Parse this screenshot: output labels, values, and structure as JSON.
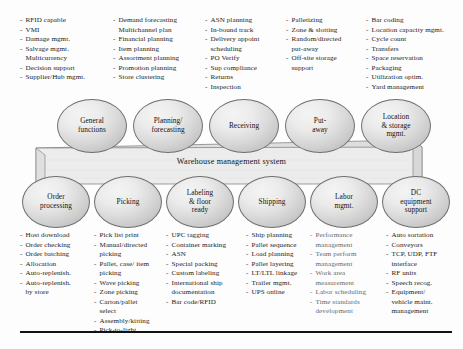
{
  "diagram": {
    "band_label": "Warehouse management system",
    "top_row": [
      {
        "name": "General\nfunctions"
      },
      {
        "name": "Planning/\nforecasting"
      },
      {
        "name": "Receiving"
      },
      {
        "name": "Put-\naway"
      },
      {
        "name": "Location\n& storage\nmgmt."
      }
    ],
    "bottom_row": [
      {
        "name": "Order\nprocessing"
      },
      {
        "name": "Picking"
      },
      {
        "name": "Labeling\n& floor\nready"
      },
      {
        "name": "Shipping"
      },
      {
        "name": "Labor\nmgmt."
      },
      {
        "name": "DC\nequipment\nsupport"
      }
    ],
    "top_columns": [
      {
        "for": "General functions",
        "items": [
          {
            "text": "RFID capable",
            "bullet": true
          },
          {
            "text": "VMI",
            "bullet": true
          },
          {
            "text": "Damage mgmt.",
            "bullet": true
          },
          {
            "text": "Salvage mgmt.",
            "bullet": true
          },
          {
            "text": "Multicurrency",
            "bullet": false
          },
          {
            "text": "Decision support",
            "bullet": true
          },
          {
            "text": "Supplier/Hub mgmt.",
            "bullet": true
          }
        ]
      },
      {
        "for": "Planning/forecasting",
        "items": [
          {
            "text": "Demand forecasting",
            "bullet": true
          },
          {
            "text": "Multichannel plan",
            "bullet": false
          },
          {
            "text": "Financial planning",
            "bullet": true
          },
          {
            "text": "Item planning",
            "bullet": true
          },
          {
            "text": "Assortment planning",
            "bullet": true
          },
          {
            "text": "Promotion planning",
            "bullet": true
          },
          {
            "text": "Store clustering",
            "bullet": true
          }
        ]
      },
      {
        "for": "Receiving",
        "items": [
          {
            "text": "ASN planning",
            "bullet": true
          },
          {
            "text": "In-bound track",
            "bullet": true
          },
          {
            "text": "Delivery appoint",
            "bullet": true
          },
          {
            "text": "scheduling",
            "bullet": false
          },
          {
            "text": "PO Verify",
            "bullet": true
          },
          {
            "text": "Sup compliance",
            "bullet": true
          },
          {
            "text": "Returns",
            "bullet": true
          },
          {
            "text": "Inspection",
            "bullet": true
          }
        ]
      },
      {
        "for": "Put-away",
        "items": [
          {
            "text": "Palletizing",
            "bullet": true
          },
          {
            "text": "Zone & slotting",
            "bullet": true
          },
          {
            "text": "Random/directed",
            "bullet": true
          },
          {
            "text": "put-away",
            "bullet": false
          },
          {
            "text": "Off-site storage",
            "bullet": true
          },
          {
            "text": "support",
            "bullet": false
          }
        ]
      },
      {
        "for": "Location & storage mgmt.",
        "items": [
          {
            "text": "Bar coding",
            "bullet": true
          },
          {
            "text": "Location capacity mgmt.",
            "bullet": true
          },
          {
            "text": "Cycle count",
            "bullet": true
          },
          {
            "text": "Transfers",
            "bullet": true
          },
          {
            "text": "Space reservation",
            "bullet": true
          },
          {
            "text": "Packaging",
            "bullet": true
          },
          {
            "text": "Utilization optim.",
            "bullet": true
          },
          {
            "text": "Yard management",
            "bullet": true
          }
        ]
      }
    ],
    "bottom_columns": [
      {
        "for": "Order processing",
        "items": [
          {
            "text": "Host download",
            "bullet": true
          },
          {
            "text": "Order checking",
            "bullet": true
          },
          {
            "text": "Order batching",
            "bullet": true
          },
          {
            "text": "Allocation",
            "bullet": true
          },
          {
            "text": "Auto-replenish.",
            "bullet": true
          },
          {
            "text": "Auto-replenish.",
            "bullet": true
          },
          {
            "text": "by store",
            "bullet": false
          }
        ]
      },
      {
        "for": "Picking",
        "items": [
          {
            "text": "Pick list print",
            "bullet": true
          },
          {
            "text": "Manual/directed",
            "bullet": true
          },
          {
            "text": "picking",
            "bullet": false
          },
          {
            "text": "Pallet, case/ item",
            "bullet": true
          },
          {
            "text": "picking",
            "bullet": false
          },
          {
            "text": "Wave picking",
            "bullet": true
          },
          {
            "text": "Zone picking",
            "bullet": true
          },
          {
            "text": "Carton/pallet",
            "bullet": true
          },
          {
            "text": "select",
            "bullet": false
          },
          {
            "text": "Assembly/kitting",
            "bullet": true
          },
          {
            "text": "Pick-to-light",
            "bullet": true
          }
        ]
      },
      {
        "for": "Labeling & floor ready",
        "items": [
          {
            "text": "UPC tagging",
            "bullet": true
          },
          {
            "text": "Container marking",
            "bullet": true
          },
          {
            "text": "ASN",
            "bullet": true
          },
          {
            "text": "Special packing",
            "bullet": true
          },
          {
            "text": "Custom labeling",
            "bullet": true
          },
          {
            "text": "International ship",
            "bullet": true
          },
          {
            "text": "documentation",
            "bullet": false
          },
          {
            "text": "Bar code/RFID",
            "bullet": true
          }
        ]
      },
      {
        "for": "Shipping",
        "items": [
          {
            "text": "Ship planning",
            "bullet": true
          },
          {
            "text": "Pallet sequence",
            "bullet": true
          },
          {
            "text": "Load planning",
            "bullet": true
          },
          {
            "text": "Pallet layering",
            "bullet": true
          },
          {
            "text": "LT/LTL linkage",
            "bullet": true
          },
          {
            "text": "Trailer mgmt.",
            "bullet": true
          },
          {
            "text": "UPS online",
            "bullet": true
          }
        ]
      },
      {
        "for": "Labor mgmt.",
        "items": [
          {
            "text": "Performance",
            "bullet": true
          },
          {
            "text": "management",
            "bullet": false
          },
          {
            "text": "Team perform",
            "bullet": true
          },
          {
            "text": "management",
            "bullet": false
          },
          {
            "text": "Work area",
            "bullet": true
          },
          {
            "text": "measurement",
            "bullet": false
          },
          {
            "text": "Labor scheduling",
            "bullet": true
          },
          {
            "text": "Time standards",
            "bullet": true
          },
          {
            "text": "development",
            "bullet": false
          }
        ]
      },
      {
        "for": "DC equipment support",
        "items": [
          {
            "text": "Auto sortation",
            "bullet": true
          },
          {
            "text": "Conveyors",
            "bullet": true
          },
          {
            "text": "TCP, UDP, FTF",
            "bullet": true
          },
          {
            "text": "interface",
            "bullet": false
          },
          {
            "text": "RF units",
            "bullet": true
          },
          {
            "text": "Speech recog.",
            "bullet": true
          },
          {
            "text": "Equipment/",
            "bullet": true
          },
          {
            "text": "vehicle maint.",
            "bullet": false
          },
          {
            "text": "management",
            "bullet": false
          }
        ]
      }
    ]
  },
  "colors": {
    "band_fill": "#e6e6e6",
    "oval_fill": "#e4e4e4",
    "stroke": "#6e6e6e",
    "text": "#1c1c1c",
    "dim_text": "#6a6a6a",
    "rule": "#111111"
  }
}
